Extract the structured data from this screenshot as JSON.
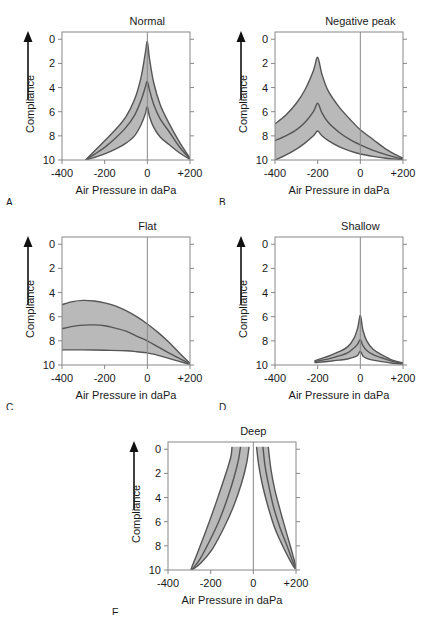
{
  "figure": {
    "axis_labels": {
      "x": "Air Pressure in daPa",
      "y": "Compliance"
    },
    "x_ticks": [
      "-400",
      "-200",
      "0",
      "+200"
    ],
    "y_ticks": [
      "0",
      "2",
      "4",
      "6",
      "8",
      "10"
    ],
    "fill_color": "#b9b9b9",
    "line_color": "#555555",
    "frame_color": "#888888"
  },
  "chart_data": {
    "type": "line",
    "xlabel": "Air Pressure in daPa",
    "ylabel": "Compliance",
    "xlim": [
      -400,
      200
    ],
    "ylim": [
      10,
      -0.6
    ],
    "x_ticks": [
      -400,
      -200,
      0,
      200
    ],
    "y_ticks": [
      0,
      2,
      4,
      6,
      8,
      10
    ],
    "grid": false,
    "legend": "none",
    "y_axis_inverted": true,
    "y_arrow_direction": "up",
    "panels": [
      {
        "letter": "A",
        "title": "Normal",
        "series": [
          {
            "name": "upper-bound",
            "points": [
              [
                -290,
                10.0
              ],
              [
                -250,
                9.3
              ],
              [
                -200,
                8.4
              ],
              [
                -150,
                7.5
              ],
              [
                -100,
                6.4
              ],
              [
                -60,
                5.0
              ],
              [
                -30,
                3.2
              ],
              [
                -10,
                1.2
              ],
              [
                0,
                0.2
              ],
              [
                10,
                1.6
              ],
              [
                30,
                3.6
              ],
              [
                60,
                5.4
              ],
              [
                100,
                6.9
              ],
              [
                150,
                8.5
              ],
              [
                200,
                9.85
              ]
            ]
          },
          {
            "name": "median",
            "points": [
              [
                -290,
                10.0
              ],
              [
                -250,
                9.55
              ],
              [
                -200,
                8.95
              ],
              [
                -150,
                8.2
              ],
              [
                -100,
                7.3
              ],
              [
                -60,
                6.3
              ],
              [
                -30,
                5.1
              ],
              [
                -10,
                4.0
              ],
              [
                0,
                3.5
              ],
              [
                10,
                4.2
              ],
              [
                30,
                5.4
              ],
              [
                60,
                6.6
              ],
              [
                100,
                7.6
              ],
              [
                150,
                8.9
              ],
              [
                200,
                9.9
              ]
            ]
          },
          {
            "name": "lower-bound",
            "points": [
              [
                -290,
                10.0
              ],
              [
                -250,
                9.8
              ],
              [
                -200,
                9.5
              ],
              [
                -150,
                9.1
              ],
              [
                -100,
                8.6
              ],
              [
                -60,
                8.0
              ],
              [
                -30,
                7.1
              ],
              [
                -10,
                6.2
              ],
              [
                0,
                5.6
              ],
              [
                10,
                6.4
              ],
              [
                30,
                7.3
              ],
              [
                60,
                8.1
              ],
              [
                100,
                8.7
              ],
              [
                150,
                9.4
              ],
              [
                200,
                9.95
              ]
            ]
          }
        ]
      },
      {
        "letter": "B",
        "title": "Negative peak",
        "series": [
          {
            "name": "upper-bound",
            "points": [
              [
                -400,
                7.0
              ],
              [
                -350,
                6.3
              ],
              [
                -300,
                5.3
              ],
              [
                -260,
                4.2
              ],
              [
                -220,
                2.6
              ],
              [
                -200,
                1.5
              ],
              [
                -180,
                2.9
              ],
              [
                -150,
                4.3
              ],
              [
                -100,
                5.6
              ],
              [
                -50,
                6.6
              ],
              [
                0,
                7.5
              ],
              [
                60,
                8.3
              ],
              [
                120,
                9.1
              ],
              [
                170,
                9.6
              ],
              [
                200,
                9.85
              ]
            ]
          },
          {
            "name": "median",
            "points": [
              [
                -400,
                8.4
              ],
              [
                -350,
                8.0
              ],
              [
                -300,
                7.5
              ],
              [
                -260,
                6.9
              ],
              [
                -220,
                6.0
              ],
              [
                -200,
                5.3
              ],
              [
                -180,
                6.1
              ],
              [
                -150,
                6.9
              ],
              [
                -100,
                7.7
              ],
              [
                -50,
                8.3
              ],
              [
                0,
                8.75
              ],
              [
                60,
                9.2
              ],
              [
                120,
                9.55
              ],
              [
                170,
                9.8
              ],
              [
                200,
                9.92
              ]
            ]
          },
          {
            "name": "lower-bound",
            "points": [
              [
                -400,
                10.0
              ],
              [
                -350,
                9.6
              ],
              [
                -300,
                9.1
              ],
              [
                -260,
                8.6
              ],
              [
                -220,
                8.0
              ],
              [
                -200,
                7.6
              ],
              [
                -180,
                8.0
              ],
              [
                -150,
                8.4
              ],
              [
                -100,
                8.9
              ],
              [
                -50,
                9.25
              ],
              [
                0,
                9.5
              ],
              [
                60,
                9.7
              ],
              [
                120,
                9.85
              ],
              [
                170,
                9.93
              ],
              [
                200,
                9.96
              ]
            ]
          }
        ]
      },
      {
        "letter": "C",
        "title": "Flat",
        "series": [
          {
            "name": "upper-bound",
            "points": [
              [
                -400,
                5.0
              ],
              [
                -350,
                4.75
              ],
              [
                -300,
                4.65
              ],
              [
                -250,
                4.7
              ],
              [
                -200,
                4.85
              ],
              [
                -150,
                5.1
              ],
              [
                -100,
                5.5
              ],
              [
                -50,
                6.0
              ],
              [
                0,
                6.6
              ],
              [
                50,
                7.3
              ],
              [
                100,
                8.1
              ],
              [
                150,
                9.0
              ],
              [
                200,
                9.85
              ]
            ]
          },
          {
            "name": "median",
            "points": [
              [
                -400,
                7.0
              ],
              [
                -350,
                6.8
              ],
              [
                -300,
                6.7
              ],
              [
                -250,
                6.68
              ],
              [
                -200,
                6.75
              ],
              [
                -150,
                6.95
              ],
              [
                -100,
                7.2
              ],
              [
                -50,
                7.6
              ],
              [
                0,
                8.0
              ],
              [
                50,
                8.5
              ],
              [
                100,
                9.0
              ],
              [
                150,
                9.45
              ],
              [
                200,
                9.9
              ]
            ]
          },
          {
            "name": "lower-bound",
            "points": [
              [
                -400,
                8.75
              ],
              [
                -300,
                8.75
              ],
              [
                -200,
                8.78
              ],
              [
                -100,
                8.82
              ],
              [
                -50,
                8.9
              ],
              [
                0,
                9.0
              ],
              [
                50,
                9.2
              ],
              [
                100,
                9.45
              ],
              [
                150,
                9.7
              ],
              [
                200,
                9.95
              ]
            ]
          }
        ]
      },
      {
        "letter": "D",
        "title": "Shallow",
        "series": [
          {
            "name": "upper-bound",
            "points": [
              [
                -215,
                9.65
              ],
              [
                -180,
                9.45
              ],
              [
                -140,
                9.2
              ],
              [
                -100,
                8.9
              ],
              [
                -60,
                8.5
              ],
              [
                -30,
                7.8
              ],
              [
                -12,
                6.9
              ],
              [
                0,
                5.9
              ],
              [
                12,
                7.1
              ],
              [
                30,
                8.0
              ],
              [
                60,
                8.7
              ],
              [
                100,
                9.15
              ],
              [
                150,
                9.6
              ],
              [
                200,
                9.82
              ]
            ]
          },
          {
            "name": "median",
            "points": [
              [
                -215,
                9.72
              ],
              [
                -180,
                9.6
              ],
              [
                -140,
                9.45
              ],
              [
                -100,
                9.25
              ],
              [
                -60,
                9.0
              ],
              [
                -30,
                8.6
              ],
              [
                -12,
                8.25
              ],
              [
                0,
                7.9
              ],
              [
                12,
                8.4
              ],
              [
                30,
                8.8
              ],
              [
                60,
                9.15
              ],
              [
                100,
                9.4
              ],
              [
                150,
                9.7
              ],
              [
                200,
                9.88
              ]
            ]
          },
          {
            "name": "lower-bound",
            "points": [
              [
                -215,
                9.8
              ],
              [
                -180,
                9.75
              ],
              [
                -140,
                9.68
              ],
              [
                -100,
                9.6
              ],
              [
                -60,
                9.5
              ],
              [
                -30,
                9.35
              ],
              [
                -12,
                9.2
              ],
              [
                0,
                8.85
              ],
              [
                12,
                9.25
              ],
              [
                30,
                9.45
              ],
              [
                60,
                9.6
              ],
              [
                100,
                9.72
              ],
              [
                150,
                9.85
              ],
              [
                200,
                9.93
              ]
            ]
          }
        ]
      },
      {
        "letter": "E",
        "title": "Deep",
        "series": [
          {
            "name": "left-outer",
            "points": [
              [
                -100,
                -0.2
              ],
              [
                -105,
                0.6
              ],
              [
                -125,
                1.8
              ],
              [
                -155,
                3.4
              ],
              [
                -190,
                5.2
              ],
              [
                -225,
                6.9
              ],
              [
                -260,
                8.5
              ],
              [
                -285,
                9.6
              ],
              [
                -293,
                10.0
              ]
            ]
          },
          {
            "name": "left-median",
            "points": [
              [
                -60,
                -0.2
              ],
              [
                -70,
                0.9
              ],
              [
                -90,
                2.3
              ],
              [
                -120,
                4.0
              ],
              [
                -160,
                5.9
              ],
              [
                -205,
                7.6
              ],
              [
                -250,
                9.1
              ],
              [
                -280,
                9.8
              ],
              [
                -292,
                10.0
              ]
            ]
          },
          {
            "name": "left-inner",
            "points": [
              [
                -20,
                -0.2
              ],
              [
                -32,
                1.2
              ],
              [
                -55,
                2.8
              ],
              [
                -90,
                4.6
              ],
              [
                -135,
                6.4
              ],
              [
                -190,
                8.2
              ],
              [
                -245,
                9.4
              ],
              [
                -280,
                9.9
              ],
              [
                -291,
                10.0
              ]
            ]
          },
          {
            "name": "right-inner",
            "points": [
              [
                15,
                -0.2
              ],
              [
                25,
                1.3
              ],
              [
                42,
                2.9
              ],
              [
                68,
                4.7
              ],
              [
                100,
                6.5
              ],
              [
                140,
                8.1
              ],
              [
                175,
                9.3
              ],
              [
                196,
                9.9
              ]
            ]
          },
          {
            "name": "right-median",
            "points": [
              [
                45,
                -0.2
              ],
              [
                55,
                1.4
              ],
              [
                72,
                3.0
              ],
              [
                95,
                4.8
              ],
              [
                125,
                6.5
              ],
              [
                160,
                8.1
              ],
              [
                185,
                9.3
              ],
              [
                199,
                9.9
              ]
            ]
          },
          {
            "name": "right-outer",
            "points": [
              [
                70,
                -0.2
              ],
              [
                82,
                1.6
              ],
              [
                100,
                3.3
              ],
              [
                125,
                5.0
              ],
              [
                152,
                6.7
              ],
              [
                178,
                8.3
              ],
              [
                195,
                9.4
              ],
              [
                202,
                9.9
              ]
            ]
          }
        ]
      }
    ]
  },
  "panels": [
    {
      "letter": "A",
      "title": "Normal"
    },
    {
      "letter": "B",
      "title": "Negative peak"
    },
    {
      "letter": "C",
      "title": "Flat"
    },
    {
      "letter": "D",
      "title": "Shallow"
    },
    {
      "letter": "E",
      "title": "Deep"
    }
  ]
}
